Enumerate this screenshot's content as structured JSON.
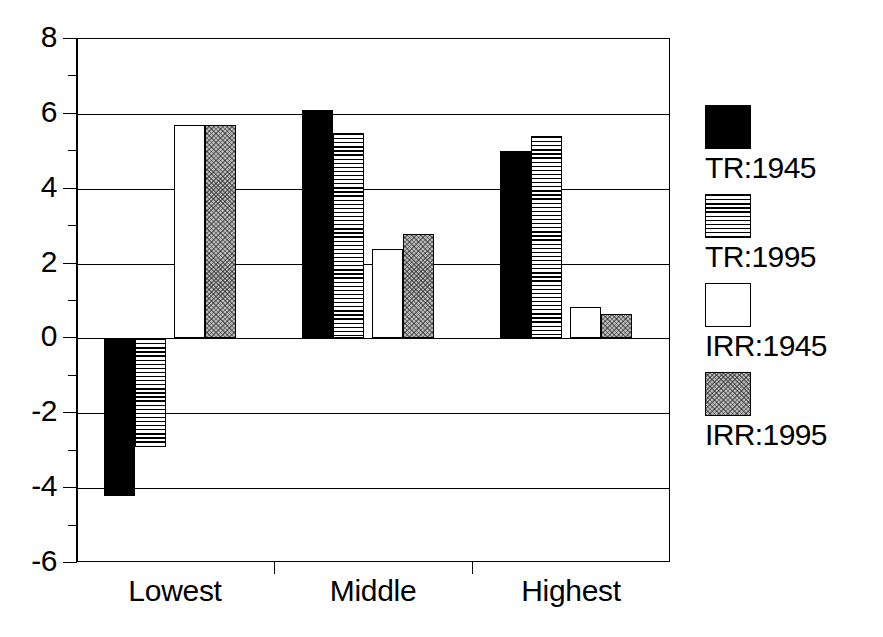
{
  "chart_data": {
    "type": "bar",
    "title": "",
    "subtitle": "",
    "xlabel": "",
    "ylabel": "",
    "categories": [
      "Lowest",
      "Middle",
      "Highest"
    ],
    "series": [
      {
        "name": "TR:1945",
        "fill": "solid-black",
        "values": [
          -4.2,
          6.1,
          5.0
        ]
      },
      {
        "name": "TR:1995",
        "fill": "horizontal-hatch",
        "values": [
          -2.9,
          5.5,
          5.4
        ]
      },
      {
        "name": "IRR:1945",
        "fill": "white",
        "values": [
          5.7,
          2.4,
          0.85
        ]
      },
      {
        "name": "IRR:1995",
        "fill": "gray-checker",
        "values": [
          5.7,
          2.8,
          0.65
        ]
      }
    ],
    "ylim": [
      -6,
      8
    ],
    "ytick_labels": [
      "8",
      "6",
      "4",
      "2",
      "0",
      "-2",
      "-4",
      "-6"
    ],
    "ytick_values": [
      8,
      6,
      4,
      2,
      0,
      -2,
      -4,
      -6
    ],
    "yminor_values": [
      7,
      5,
      3,
      1,
      -1,
      -3,
      -5
    ],
    "grid": "horizontal",
    "legend_position": "right",
    "colors": {
      "black": "#000000",
      "white": "#ffffff",
      "gray": "#b7b7b7",
      "axis": "#000000",
      "background": "#ffffff"
    }
  },
  "legend": {
    "items": [
      {
        "label": "TR:1945",
        "swatch": "solid-black-swatch"
      },
      {
        "label": "TR:1995",
        "swatch": "horizontal-hatch-swatch"
      },
      {
        "label": "IRR:1945",
        "swatch": "white-swatch"
      },
      {
        "label": "IRR:1995",
        "swatch": "gray-checker-swatch"
      }
    ]
  }
}
